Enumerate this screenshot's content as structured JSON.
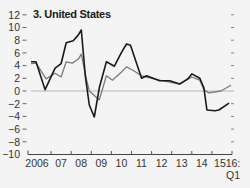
{
  "chart_data": {
    "type": "line",
    "title": "3. United States",
    "xlabel": "",
    "ylabel": "",
    "ylim": [
      -10,
      12
    ],
    "yticks": [
      12,
      10,
      8,
      6,
      4,
      2,
      0,
      -2,
      -4,
      -6,
      -8,
      -10
    ],
    "ytick_labels": [
      "12",
      "10",
      "8",
      "6",
      "4",
      "2",
      "0",
      "−2",
      "−4",
      "−6",
      "−8",
      "−10"
    ],
    "xlim": [
      2006.0,
      2016.0
    ],
    "xticks": [
      2006,
      2007,
      2008,
      2009,
      2010,
      2011,
      2012,
      2013,
      2014,
      2015,
      2016
    ],
    "xtick_labels": [
      "2006",
      "07",
      "08",
      "09",
      "10",
      "11",
      "12",
      "13",
      "14",
      "15",
      "16:"
    ],
    "xtick_sublabel": "Q1",
    "grid": false,
    "zero_line": true,
    "legend": "none",
    "series": [
      {
        "name": "series-dark",
        "color": "#1a1a1a",
        "points": [
          [
            2006.0,
            4.6
          ],
          [
            2006.25,
            4.6
          ],
          [
            2006.7,
            0.2
          ],
          [
            2007.2,
            3.6
          ],
          [
            2007.5,
            4.3
          ],
          [
            2007.75,
            7.6
          ],
          [
            2008.1,
            7.9
          ],
          [
            2008.35,
            8.8
          ],
          [
            2008.5,
            9.6
          ],
          [
            2008.7,
            2.4
          ],
          [
            2008.9,
            -2.2
          ],
          [
            2009.15,
            -4.1
          ],
          [
            2009.4,
            0.5
          ],
          [
            2009.75,
            4.6
          ],
          [
            2010.15,
            3.9
          ],
          [
            2010.5,
            6.1
          ],
          [
            2010.75,
            7.4
          ],
          [
            2010.95,
            7.2
          ],
          [
            2011.5,
            2.0
          ],
          [
            2011.75,
            2.4
          ],
          [
            2012.4,
            1.6
          ],
          [
            2012.9,
            1.6
          ],
          [
            2013.4,
            1.1
          ],
          [
            2013.8,
            1.9
          ],
          [
            2014.0,
            2.7
          ],
          [
            2014.4,
            2.0
          ],
          [
            2014.6,
            0.5
          ],
          [
            2014.75,
            -3.0
          ],
          [
            2015.15,
            -3.1
          ],
          [
            2015.35,
            -3.0
          ],
          [
            2015.85,
            -1.9
          ]
        ]
      },
      {
        "name": "series-gray",
        "color": "#7a7a7a",
        "points": [
          [
            2006.0,
            4.3
          ],
          [
            2006.25,
            4.4
          ],
          [
            2006.75,
            1.9
          ],
          [
            2007.2,
            2.8
          ],
          [
            2007.5,
            2.2
          ],
          [
            2007.75,
            4.6
          ],
          [
            2008.05,
            4.4
          ],
          [
            2008.35,
            5.0
          ],
          [
            2008.5,
            5.8
          ],
          [
            2008.75,
            1.9
          ],
          [
            2008.9,
            0.0
          ],
          [
            2009.4,
            -1.4
          ],
          [
            2009.75,
            2.4
          ],
          [
            2010.05,
            1.7
          ],
          [
            2010.5,
            3.0
          ],
          [
            2010.75,
            3.8
          ],
          [
            2011.05,
            3.3
          ],
          [
            2011.5,
            2.4
          ],
          [
            2011.75,
            2.2
          ],
          [
            2012.4,
            1.7
          ],
          [
            2012.9,
            1.4
          ],
          [
            2013.4,
            1.1
          ],
          [
            2014.0,
            2.2
          ],
          [
            2014.4,
            1.7
          ],
          [
            2014.6,
            0.2
          ],
          [
            2014.85,
            -0.3
          ],
          [
            2015.45,
            0.0
          ],
          [
            2015.95,
            0.9
          ]
        ]
      }
    ]
  }
}
